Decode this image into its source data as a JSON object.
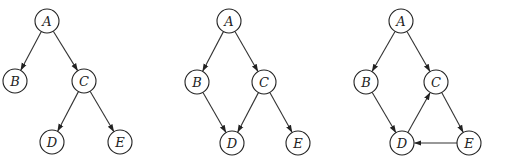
{
  "diagram": {
    "type": "directed-graphs",
    "node_radius": 12,
    "stroke_color": "#222222",
    "background": "#ffffff",
    "graphs": [
      {
        "id": "graph-1",
        "nodes": [
          {
            "id": "A",
            "label": "A",
            "x": 47,
            "y": 21
          },
          {
            "id": "B",
            "label": "B",
            "x": 15,
            "y": 81
          },
          {
            "id": "C",
            "label": "C",
            "x": 84,
            "y": 81
          },
          {
            "id": "D",
            "label": "D",
            "x": 52,
            "y": 142
          },
          {
            "id": "E",
            "label": "E",
            "x": 120,
            "y": 142
          }
        ],
        "edges": [
          {
            "from": "A",
            "to": "B"
          },
          {
            "from": "A",
            "to": "C"
          },
          {
            "from": "C",
            "to": "D"
          },
          {
            "from": "C",
            "to": "E"
          }
        ]
      },
      {
        "id": "graph-2",
        "nodes": [
          {
            "id": "A",
            "label": "A",
            "x": 229,
            "y": 21
          },
          {
            "id": "B",
            "label": "B",
            "x": 197,
            "y": 82
          },
          {
            "id": "C",
            "label": "C",
            "x": 264,
            "y": 82
          },
          {
            "id": "D",
            "label": "D",
            "x": 232,
            "y": 143
          },
          {
            "id": "E",
            "label": "E",
            "x": 298,
            "y": 143
          }
        ],
        "edges": [
          {
            "from": "A",
            "to": "B"
          },
          {
            "from": "A",
            "to": "C"
          },
          {
            "from": "B",
            "to": "D"
          },
          {
            "from": "C",
            "to": "D"
          },
          {
            "from": "C",
            "to": "E"
          }
        ]
      },
      {
        "id": "graph-3",
        "nodes": [
          {
            "id": "A",
            "label": "A",
            "x": 401,
            "y": 21
          },
          {
            "id": "B",
            "label": "B",
            "x": 366,
            "y": 82
          },
          {
            "id": "C",
            "label": "C",
            "x": 436,
            "y": 82
          },
          {
            "id": "D",
            "label": "D",
            "x": 402,
            "y": 143
          },
          {
            "id": "E",
            "label": "E",
            "x": 469,
            "y": 143
          }
        ],
        "edges": [
          {
            "from": "A",
            "to": "B"
          },
          {
            "from": "A",
            "to": "C"
          },
          {
            "from": "B",
            "to": "D"
          },
          {
            "from": "D",
            "to": "C"
          },
          {
            "from": "C",
            "to": "E"
          },
          {
            "from": "E",
            "to": "D"
          }
        ]
      }
    ]
  }
}
